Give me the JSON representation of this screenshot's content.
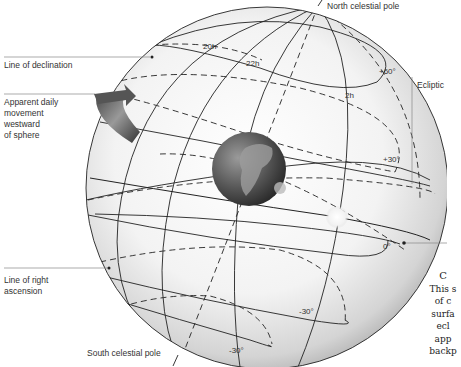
{
  "labels": {
    "north_pole": "North celestial pole",
    "south_pole": "South celestial pole",
    "line_of_declination": "Line of declination",
    "apparent_movement": [
      "Apparent daily",
      "movement",
      "westward",
      "of sphere"
    ],
    "ecliptic": "Ecliptic",
    "line_of_right_ascension": [
      "Line of right",
      "ascension"
    ]
  },
  "hour_ticks": [
    "20h",
    "22h",
    "2h"
  ],
  "declination_ticks": {
    "plus60": "+60°",
    "plus30": "+30°",
    "zero": "0°",
    "minus30_a": "-30°",
    "minus30_b": "-30°"
  },
  "caption_fragment": [
    "C",
    "This s",
    "of c",
    "surfa",
    "ecl",
    "app",
    "backp"
  ],
  "colors": {
    "sphere_light": "#ffffff",
    "sphere_dark": "#b8b8b8",
    "line": "#222222",
    "leader": "#888888",
    "earth": "#6a6a6a",
    "sun": "#f4f4f4"
  }
}
